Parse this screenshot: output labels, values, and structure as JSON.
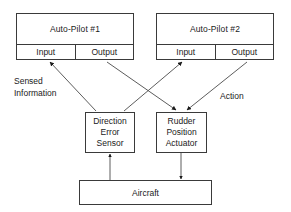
{
  "diagram": {
    "background_color": "#ffffff",
    "line_color": "#3a3a3a",
    "text_color": "#1a1a1a",
    "autopilots": [
      {
        "name": "Auto-Pilot #1",
        "input_label": "Input",
        "output_label": "Output"
      },
      {
        "name": "Auto-Pilot #2",
        "input_label": "Input",
        "output_label": "Output"
      }
    ],
    "sensor": {
      "line1": "Direction",
      "line2": "Error",
      "line3": "Sensor"
    },
    "actuator": {
      "line1": "Rudder",
      "line2": "Position",
      "line3": "Actuator"
    },
    "plant": {
      "name": "Aircraft"
    },
    "annotations": {
      "sensed_line1": "Sensed",
      "sensed_line2": "Information",
      "action": "Action"
    },
    "connections": [
      {
        "from": "Direction Error Sensor",
        "to": "Auto-Pilot #1 Input",
        "label": "Sensed Information"
      },
      {
        "from": "Direction Error Sensor",
        "to": "Auto-Pilot #2 Input",
        "label": "Sensed Information"
      },
      {
        "from": "Auto-Pilot #1 Output",
        "to": "Rudder Position Actuator",
        "label": "Action"
      },
      {
        "from": "Auto-Pilot #2 Output",
        "to": "Rudder Position Actuator",
        "label": "Action"
      },
      {
        "from": "Aircraft",
        "to": "Direction Error Sensor",
        "label": ""
      },
      {
        "from": "Rudder Position Actuator",
        "to": "Aircraft",
        "label": ""
      }
    ]
  }
}
